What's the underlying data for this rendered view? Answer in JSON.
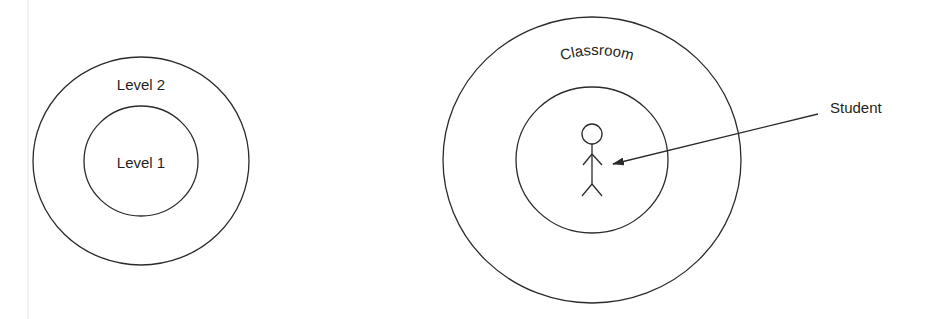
{
  "diagram": {
    "left": {
      "outer_label": "Level 2",
      "inner_label": "Level 1"
    },
    "right": {
      "outer_label": "Classroom",
      "figure_label": "Student",
      "figure_icon": "stick-figure-icon",
      "pointer_icon": "arrow-icon"
    },
    "colors": {
      "stroke": "#2b2b2b",
      "text": "#1f1f1f",
      "background": "#ffffff"
    }
  }
}
